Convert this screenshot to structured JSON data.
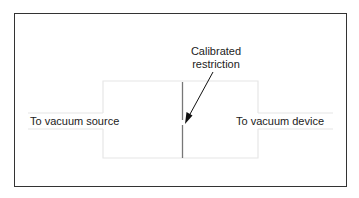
{
  "diagram": {
    "title_line1": "Calibrated",
    "title_line2": "restriction",
    "left_label": "To vacuum source",
    "right_label": "To vacuum device"
  },
  "colors": {
    "frame": "#333333",
    "pipe_outline": "#e8e8e8",
    "restriction": "#666666",
    "arrow": "#111111",
    "text": "#222222"
  }
}
